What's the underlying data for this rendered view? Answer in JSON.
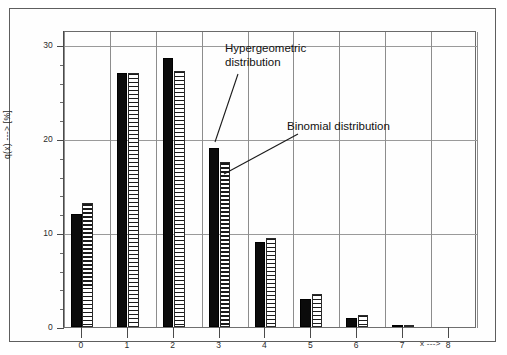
{
  "chart_data": {
    "type": "bar",
    "title": "",
    "subtitle": "",
    "xlabel": "x --->",
    "ylabel": "q(x) ---> [%]",
    "categories": [
      "0",
      "1",
      "2",
      "3",
      "4",
      "5",
      "6",
      "7",
      "8"
    ],
    "x": [
      0,
      1,
      2,
      3,
      4,
      5,
      6,
      7,
      8
    ],
    "series": [
      {
        "name": "Hypergeometric distribution",
        "style": "solid-black",
        "values": [
          12.0,
          27.0,
          28.6,
          19.0,
          9.0,
          3.0,
          1.0,
          0.2,
          0.0
        ]
      },
      {
        "name": "Binomial distribution",
        "style": "horizontal-hatch",
        "values": [
          13.2,
          27.0,
          27.2,
          17.6,
          9.5,
          3.5,
          1.3,
          0.2,
          0.0
        ]
      }
    ],
    "ylim": [
      0,
      31.5
    ],
    "yticks_major": [
      0,
      10,
      20,
      30
    ],
    "yticks_minor": [
      2,
      4,
      6,
      8,
      12,
      14,
      16,
      18,
      22,
      24,
      26,
      28
    ],
    "xticks": [
      0,
      1,
      2,
      3,
      4,
      5,
      6,
      7,
      8
    ],
    "grid": "both",
    "legend_position": "none",
    "annotations": [
      {
        "id": "hypergeometric",
        "text": "Hypergeometric\ndistribution",
        "points_to_series": "Hypergeometric distribution",
        "points_to_category": "3"
      },
      {
        "id": "binomial",
        "text": "Binomial distribution",
        "points_to_series": "Binomial distribution",
        "points_to_category": "3"
      }
    ],
    "colors": {
      "series_solid": "#0b0b0b",
      "series_hatch": "#1b1b1b",
      "grid": "#8d8d8d",
      "axis": "#4a4a4a",
      "background": "#ffffff"
    }
  }
}
